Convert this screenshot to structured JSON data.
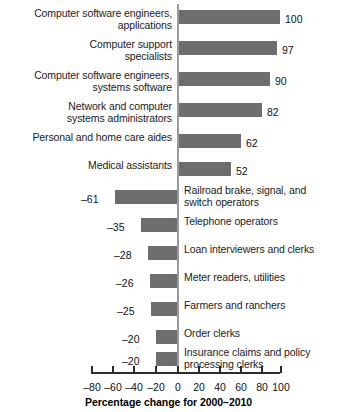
{
  "chart_data": {
    "type": "bar",
    "orientation": "horizontal",
    "title": "",
    "xlabel": "Percentage change for 2000–2010",
    "ylabel": "",
    "xlim": [
      -80,
      100
    ],
    "xticks": [
      -80,
      -60,
      -40,
      -20,
      0,
      20,
      40,
      60,
      80,
      100
    ],
    "xtick_labels": [
      "–80",
      "–60",
      "–40",
      "–20",
      "0",
      "20",
      "40",
      "60",
      "80",
      "100"
    ],
    "grid": false,
    "legend": null,
    "bar_color": "#6d6d6d",
    "zero_line_color": "#9a9a9a",
    "axis_color": "#2b2b2b",
    "categories": [
      "Computer software engineers,\napplications",
      "Computer support\nspecialists",
      "Computer software engineers,\nsystems software",
      "Network and computer\nsystems administrators",
      "Personal and home care aides",
      "Medical assistants",
      "Railroad brake, signal, and\nswitch operators",
      "Telephone operators",
      "Loan interviewers and clerks",
      "Meter readers, utilities",
      "Farmers and ranchers",
      "Order clerks",
      "Insurance claims and policy\nprocessing clerks"
    ],
    "values": [
      100,
      97,
      90,
      82,
      62,
      52,
      -61,
      -35,
      -28,
      -26,
      -25,
      -20,
      -20
    ],
    "value_labels": [
      "100",
      "97",
      "90",
      "82",
      "62",
      "52",
      "–61",
      "–35",
      "–28",
      "–26",
      "–25",
      "–20",
      "–20"
    ]
  },
  "bars": [
    {
      "label": "Computer software engineers,\napplications",
      "value_label": "100",
      "label_side": "left",
      "top": 10,
      "label_top": 7,
      "bar_left": 178,
      "bar_width": 102,
      "val_left": 285,
      "val_top": 13
    },
    {
      "label": "Computer support\nspecialists",
      "value_label": "97",
      "label_side": "left",
      "top": 41,
      "label_top": 38,
      "bar_left": 178,
      "bar_width": 99,
      "val_left": 282,
      "val_top": 44
    },
    {
      "label": "Computer software engineers,\nsystems software",
      "value_label": "90",
      "label_side": "left",
      "top": 72,
      "label_top": 69,
      "bar_left": 178,
      "bar_width": 92,
      "val_left": 275,
      "val_top": 75
    },
    {
      "label": "Network and computer\nsystems administrators",
      "top": 103,
      "value_label": "82",
      "label_side": "left",
      "label_top": 100,
      "bar_left": 178,
      "bar_width": 84,
      "val_left": 267,
      "val_top": 106
    },
    {
      "label": "Personal and home care aides",
      "value_label": "62",
      "label_side": "left",
      "top": 134,
      "label_top": 131,
      "bar_left": 178,
      "bar_width": 63,
      "val_left": 246,
      "val_top": 137
    },
    {
      "label": "Medical assistants",
      "value_label": "52",
      "label_side": "left",
      "top": 162,
      "label_top": 159,
      "bar_left": 178,
      "bar_width": 53,
      "val_left": 236,
      "val_top": 165
    },
    {
      "label": "Railroad brake, signal, and\nswitch operators",
      "value_label": "–61",
      "label_side": "right",
      "top": 190,
      "label_top": 184,
      "bar_left": 115,
      "bar_width": 62,
      "val_left": 81,
      "val_top": 193
    },
    {
      "label": "Telephone operators",
      "value_label": "–35",
      "label_side": "right",
      "top": 218,
      "label_top": 215,
      "bar_left": 141,
      "bar_width": 36,
      "val_left": 107,
      "val_top": 221
    },
    {
      "label": "Loan interviewers and clerks",
      "value_label": "–28",
      "label_side": "right",
      "top": 246,
      "label_top": 243,
      "bar_left": 148,
      "bar_width": 29,
      "val_left": 114,
      "val_top": 249
    },
    {
      "label": "Meter readers, utilities",
      "value_label": "–26",
      "label_side": "right",
      "top": 274,
      "label_top": 271,
      "bar_left": 150,
      "bar_width": 27,
      "val_left": 116,
      "val_top": 277
    },
    {
      "label": "Farmers and ranchers",
      "value_label": "–25",
      "label_side": "right",
      "top": 302,
      "label_top": 299,
      "bar_left": 151,
      "bar_width": 26,
      "val_left": 117,
      "val_top": 305
    },
    {
      "label": "Order clerks",
      "value_label": "–20",
      "label_side": "right",
      "top": 330,
      "label_top": 327,
      "bar_left": 156,
      "bar_width": 21,
      "val_left": 122,
      "val_top": 333
    },
    {
      "label": "Insurance claims and policy\nprocessing clerks",
      "value_label": "–20",
      "label_side": "right",
      "top": 352,
      "label_top": 346,
      "bar_left": 156,
      "bar_width": 21,
      "val_left": 122,
      "val_top": 355
    }
  ],
  "axis": {
    "caption": "Percentage change for 2000–2010",
    "ticks": [
      {
        "label": "–80",
        "x": 91
      },
      {
        "label": "–60",
        "x": 112
      },
      {
        "label": "–40",
        "x": 133
      },
      {
        "label": "–20",
        "x": 155
      },
      {
        "label": "0",
        "x": 177
      },
      {
        "label": "20",
        "x": 198
      },
      {
        "label": "40",
        "x": 219
      },
      {
        "label": "60",
        "x": 240
      },
      {
        "label": "80",
        "x": 261
      },
      {
        "label": "100",
        "x": 280
      }
    ]
  }
}
